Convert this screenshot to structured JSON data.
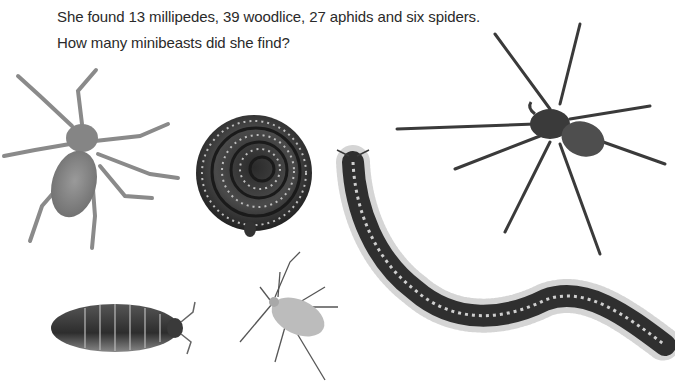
{
  "question": {
    "line1": "She found 13 millipedes, 39 woodlice, 27 aphids and six spiders.",
    "line2": "How many minibeasts did she find?"
  },
  "images": [
    {
      "name": "pale-spider",
      "label": "spider"
    },
    {
      "name": "coiled-millipede",
      "label": "millipede"
    },
    {
      "name": "dark-spider",
      "label": "spider"
    },
    {
      "name": "long-millipede",
      "label": "millipede"
    },
    {
      "name": "woodlouse",
      "label": "woodlouse"
    },
    {
      "name": "aphid",
      "label": "aphid"
    }
  ],
  "colors": {
    "text": "#2a2a2a",
    "background": "#ffffff"
  }
}
